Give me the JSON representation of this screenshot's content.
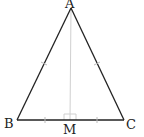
{
  "diagram": {
    "type": "geometry",
    "points": {
      "A": {
        "label": "A",
        "x": 71,
        "y": 8
      },
      "B": {
        "label": "B",
        "x": 17,
        "y": 120
      },
      "C": {
        "label": "C",
        "x": 124,
        "y": 120
      },
      "M": {
        "label": "M",
        "x": 70,
        "y": 120
      }
    },
    "segments": [
      {
        "from": "A",
        "to": "B",
        "style": "solid"
      },
      {
        "from": "A",
        "to": "C",
        "style": "solid"
      },
      {
        "from": "B",
        "to": "C",
        "style": "solid"
      },
      {
        "from": "A",
        "to": "M",
        "style": "thin-gray"
      }
    ],
    "equal_marks": [
      "AB = AC",
      "BM = MC"
    ],
    "right_angle_at": "M",
    "colors": {
      "line": "#222222",
      "aux": "#cccccc"
    }
  }
}
